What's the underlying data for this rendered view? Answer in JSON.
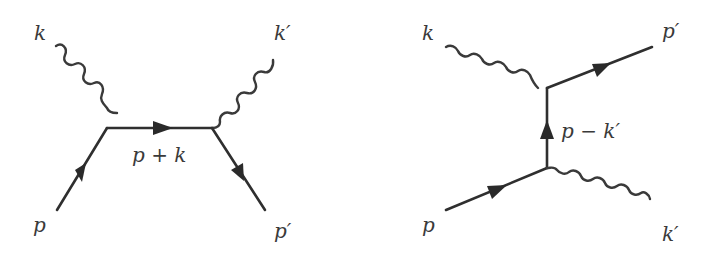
{
  "figure": {
    "colors": {
      "line": "#2f2f2f",
      "label": "#3a3a3a",
      "background": "#ffffff"
    }
  },
  "diagrams": [
    {
      "id": "s-channel",
      "labels": {
        "incoming_photon": "k",
        "outgoing_photon": "k′",
        "incoming_fermion": "p",
        "outgoing_fermion": "p′",
        "propagator": "p + k"
      },
      "vertices": [
        [
          107,
          128
        ],
        [
          212,
          128
        ]
      ],
      "lines": [
        {
          "type": "photon",
          "from": [
            56,
            46
          ],
          "to": [
            107,
            128
          ],
          "label": "k"
        },
        {
          "type": "fermion",
          "from": [
            57,
            210
          ],
          "to": [
            107,
            128
          ],
          "label": "p",
          "arrow": "toward-vertex"
        },
        {
          "type": "fermion",
          "from": [
            107,
            128
          ],
          "to": [
            212,
            128
          ],
          "label": "p + k",
          "arrow": "right"
        },
        {
          "type": "photon",
          "from": [
            212,
            128
          ],
          "to": [
            265,
            48
          ],
          "label": "k′"
        },
        {
          "type": "fermion",
          "from": [
            212,
            128
          ],
          "to": [
            265,
            210
          ],
          "label": "p′",
          "arrow": "away-from-vertex"
        }
      ]
    },
    {
      "id": "u-channel",
      "labels": {
        "incoming_photon": "k",
        "outgoing_photon": "k′",
        "incoming_fermion": "p",
        "outgoing_fermion": "p′",
        "propagator": "p − k′"
      },
      "vertices": [
        [
          547,
          88
        ],
        [
          547,
          168
        ]
      ],
      "lines": [
        {
          "type": "photon",
          "from": [
            446,
            47
          ],
          "to": [
            547,
            88
          ],
          "label": "k"
        },
        {
          "type": "fermion",
          "from": [
            547,
            88
          ],
          "to": [
            652,
            47
          ],
          "label": "p′",
          "arrow": "away-from-vertex"
        },
        {
          "type": "fermion",
          "from": [
            547,
            168
          ],
          "to": [
            547,
            88
          ],
          "label": "p − k′",
          "arrow": "up"
        },
        {
          "type": "fermion",
          "from": [
            446,
            210
          ],
          "to": [
            547,
            168
          ],
          "label": "p",
          "arrow": "toward-vertex"
        },
        {
          "type": "photon",
          "from": [
            547,
            168
          ],
          "to": [
            652,
            211
          ],
          "label": "k′"
        }
      ]
    }
  ]
}
